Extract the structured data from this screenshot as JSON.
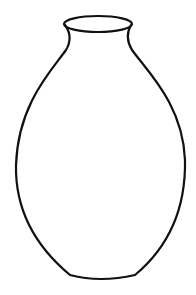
{
  "image": {
    "subject": "vase line drawing",
    "background_color": "#ffffff",
    "stroke_color": "#111111"
  }
}
